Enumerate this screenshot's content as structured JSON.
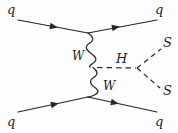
{
  "diagram": {
    "type": "feynman-diagram",
    "stroke_color": "#262626",
    "background_color": "#fdfdfd",
    "labels": {
      "quark_in_top": "q",
      "quark_out_top": "q",
      "quark_in_bottom": "q",
      "quark_out_bottom": "q",
      "boson_top": "W",
      "boson_bottom": "W",
      "higgs": "H",
      "scalar_top": "S",
      "scalar_bottom": "S"
    },
    "lines": [
      {
        "name": "incoming-quark-top",
        "style": "solid",
        "arrow": true
      },
      {
        "name": "outgoing-quark-top",
        "style": "solid",
        "arrow": true
      },
      {
        "name": "incoming-quark-bottom",
        "style": "solid",
        "arrow": true
      },
      {
        "name": "outgoing-quark-bottom",
        "style": "solid",
        "arrow": true
      },
      {
        "name": "w-propagator-top",
        "style": "wavy",
        "arrow": false
      },
      {
        "name": "w-propagator-bottom",
        "style": "wavy",
        "arrow": false
      },
      {
        "name": "higgs-propagator",
        "style": "dashed",
        "arrow": false
      },
      {
        "name": "scalar-top",
        "style": "dashed",
        "arrow": false
      },
      {
        "name": "scalar-bottom",
        "style": "dashed",
        "arrow": false
      }
    ],
    "vertices": [
      {
        "name": "top-wwq-vertex",
        "x": 88,
        "y": 33
      },
      {
        "name": "bottom-wwq-vertex",
        "x": 88,
        "y": 97
      },
      {
        "name": "hww-vertex",
        "x": 96,
        "y": 67
      },
      {
        "name": "hss-vertex",
        "x": 137,
        "y": 68
      }
    ]
  }
}
